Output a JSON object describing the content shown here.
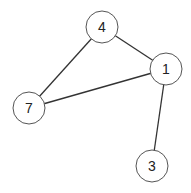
{
  "graph": {
    "nodes": [
      {
        "id": "4",
        "label": "4",
        "x": 102,
        "y": 27
      },
      {
        "id": "1",
        "label": "1",
        "x": 166,
        "y": 69
      },
      {
        "id": "7",
        "label": "7",
        "x": 29,
        "y": 108
      },
      {
        "id": "3",
        "label": "3",
        "x": 152,
        "y": 166
      }
    ],
    "edges": [
      {
        "from": "4",
        "to": "1"
      },
      {
        "from": "4",
        "to": "7"
      },
      {
        "from": "7",
        "to": "1"
      },
      {
        "from": "1",
        "to": "3"
      }
    ],
    "node_radius": 16
  }
}
